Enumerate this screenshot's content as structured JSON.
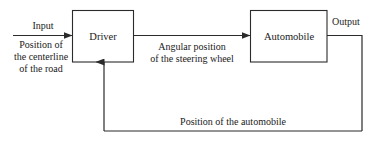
{
  "diagram": {
    "type": "block-diagram",
    "title_shown": false,
    "background_color": "#ffffff",
    "line_color": "#2b2b2b",
    "text_color": "#1a1a1a",
    "blocks": [
      {
        "id": "driver",
        "label": "Driver",
        "x": 72,
        "y": 10,
        "width": 61,
        "height": 52
      },
      {
        "id": "automobile",
        "label": "Automobile",
        "x": 250,
        "y": 10,
        "width": 77,
        "height": 52
      }
    ],
    "signals": {
      "input_name": "Input",
      "input_desc_line1": "Position of",
      "input_desc_line2": "the centerline",
      "input_desc_line3": "of the road",
      "middle_desc_line1": "Angular position",
      "middle_desc_line2": "of the steering wheel",
      "output_name": "Output",
      "feedback_label": "Position of the automobile"
    }
  }
}
